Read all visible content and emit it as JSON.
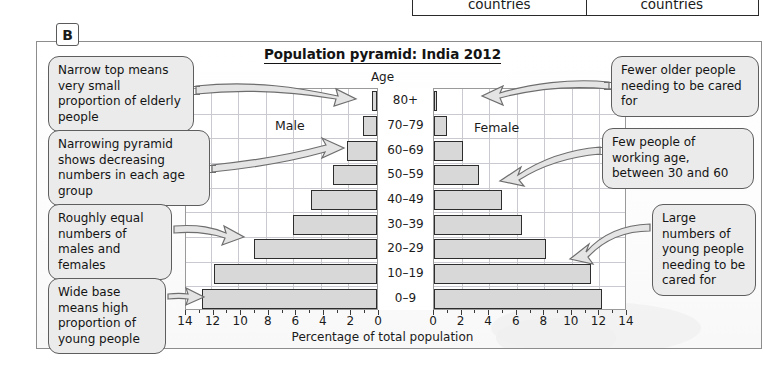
{
  "top_fragment": {
    "left_cell": "countries",
    "right_cell": "countries"
  },
  "badge": {
    "label": "B"
  },
  "chart_panel": {
    "title": "Population pyramid: India 2012",
    "age_axis_caption": "Age",
    "male_label": "Male",
    "female_label": "Female",
    "x_axis_title": "Percentage of total population",
    "x_ticks_left": [
      "14",
      "12",
      "10",
      "8",
      "6",
      "4",
      "2",
      "0"
    ],
    "x_ticks_right": [
      "0",
      "2",
      "4",
      "6",
      "8",
      "10",
      "12",
      "14"
    ]
  },
  "callouts": [
    {
      "id": "narrow-top",
      "text": "Narrow top means very small proportion of elderly people"
    },
    {
      "id": "narrowing",
      "text": "Narrowing pyramid shows decreasing numbers in each age group"
    },
    {
      "id": "roughly-equal",
      "text": "Roughly equal numbers of males and females"
    },
    {
      "id": "wide-base",
      "text": "Wide base means high proportion of young people"
    },
    {
      "id": "fewer-older",
      "text": "Fewer older people needing to be cared for"
    },
    {
      "id": "few-working-age",
      "text": "Few people of working age, between 30 and 60"
    },
    {
      "id": "large-young",
      "text": "Large numbers of young people needing to be cared for"
    }
  ],
  "chart_data": {
    "type": "bar",
    "title": "Population pyramid: India 2012",
    "xlabel": "Percentage of total population",
    "ylabel": "Age",
    "xlim": [
      0,
      14
    ],
    "grid": true,
    "legend_position": "inside-top",
    "categories": [
      "0–9",
      "10–19",
      "20–29",
      "30–39",
      "40–49",
      "50–59",
      "60–69",
      "70–79",
      "80+"
    ],
    "series": [
      {
        "name": "Male",
        "values": [
          12.7,
          11.8,
          8.9,
          6.1,
          4.8,
          3.2,
          2.2,
          1.0,
          0.35
        ]
      },
      {
        "name": "Female",
        "values": [
          12.2,
          11.4,
          8.1,
          6.4,
          4.9,
          3.3,
          2.1,
          0.95,
          0.25
        ]
      }
    ]
  }
}
